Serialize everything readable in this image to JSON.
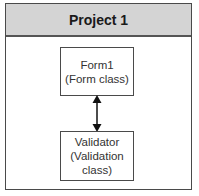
{
  "diagram": {
    "container": {
      "title": "Project 1",
      "header_color": "#d4d4d4",
      "border_color": "#4a4a4a"
    },
    "nodes": [
      {
        "id": "form1",
        "line1": "Form1",
        "line2": "(Form class)",
        "line3": ""
      },
      {
        "id": "validator",
        "line1": "Validator",
        "line2": "(Validation",
        "line3": "class)"
      }
    ],
    "edges": [
      {
        "from": "form1",
        "to": "validator",
        "type": "bidirectional-arrow"
      }
    ]
  }
}
